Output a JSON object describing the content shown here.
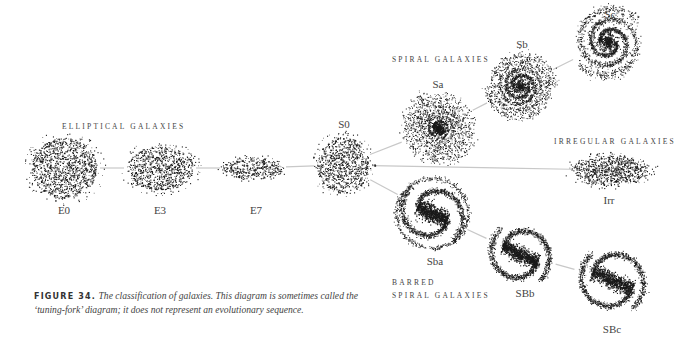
{
  "diagram": {
    "group_labels": {
      "elliptical": "ELLIPTICAL GALAXIES",
      "spiral": "SPIRAL GALAXIES",
      "irregular": "IRREGULAR GALAXIES",
      "barred_line1": "BARRED",
      "barred_line2": "SPIRAL GALAXIES"
    },
    "galaxies": [
      {
        "id": "E0",
        "label": "E0",
        "type": "elliptical",
        "cx": 64,
        "cy": 168,
        "rx": 33,
        "ry": 30
      },
      {
        "id": "E3",
        "label": "E3",
        "type": "elliptical",
        "cx": 160,
        "cy": 168,
        "rx": 33,
        "ry": 22
      },
      {
        "id": "E7",
        "label": "E7",
        "type": "elliptical",
        "cx": 253,
        "cy": 168,
        "rx": 30,
        "ry": 11
      },
      {
        "id": "S0",
        "label": "S0",
        "type": "lenticular",
        "cx": 343,
        "cy": 165,
        "rx": 26,
        "ry": 28
      },
      {
        "id": "Sa",
        "label": "Sa",
        "type": "spiral",
        "cx": 438,
        "cy": 128,
        "r": 36
      },
      {
        "id": "Sb",
        "label": "Sb",
        "type": "spiral",
        "cx": 520,
        "cy": 86,
        "r": 34
      },
      {
        "id": "Sc",
        "label": "Sc",
        "type": "spiral",
        "cx": 608,
        "cy": 42,
        "r": 36
      },
      {
        "id": "Sba",
        "label": "Sba",
        "type": "barred",
        "cx": 432,
        "cy": 213,
        "r": 36
      },
      {
        "id": "SBb",
        "label": "SBb",
        "type": "barred",
        "cx": 520,
        "cy": 254,
        "r": 34
      },
      {
        "id": "SBc",
        "label": "SBc",
        "type": "barred",
        "cx": 612,
        "cy": 280,
        "r": 36
      },
      {
        "id": "Irr",
        "label": "Irr",
        "type": "irregular",
        "cx": 610,
        "cy": 170,
        "rx": 36,
        "ry": 14
      }
    ],
    "connectors": [
      [
        "E0",
        "E3"
      ],
      [
        "E3",
        "E7"
      ],
      [
        "E7",
        "S0"
      ],
      [
        "S0",
        "Sa"
      ],
      [
        "Sa",
        "Sb"
      ],
      [
        "Sb",
        "Sc"
      ],
      [
        "S0",
        "Irr"
      ],
      [
        "S0",
        "Sba"
      ],
      [
        "Sba",
        "SBb"
      ],
      [
        "SBb",
        "SBc"
      ]
    ],
    "colors": {
      "dots": "#1a1a1a",
      "lines": "#c8c8c8",
      "text": "#444444"
    }
  },
  "caption": {
    "figure_label": "FIGURE 34.",
    "text": "The classification of galaxies. This diagram is sometimes called the ‘tuning-fork’ diagram; it does not represent an evolutionary sequence."
  }
}
